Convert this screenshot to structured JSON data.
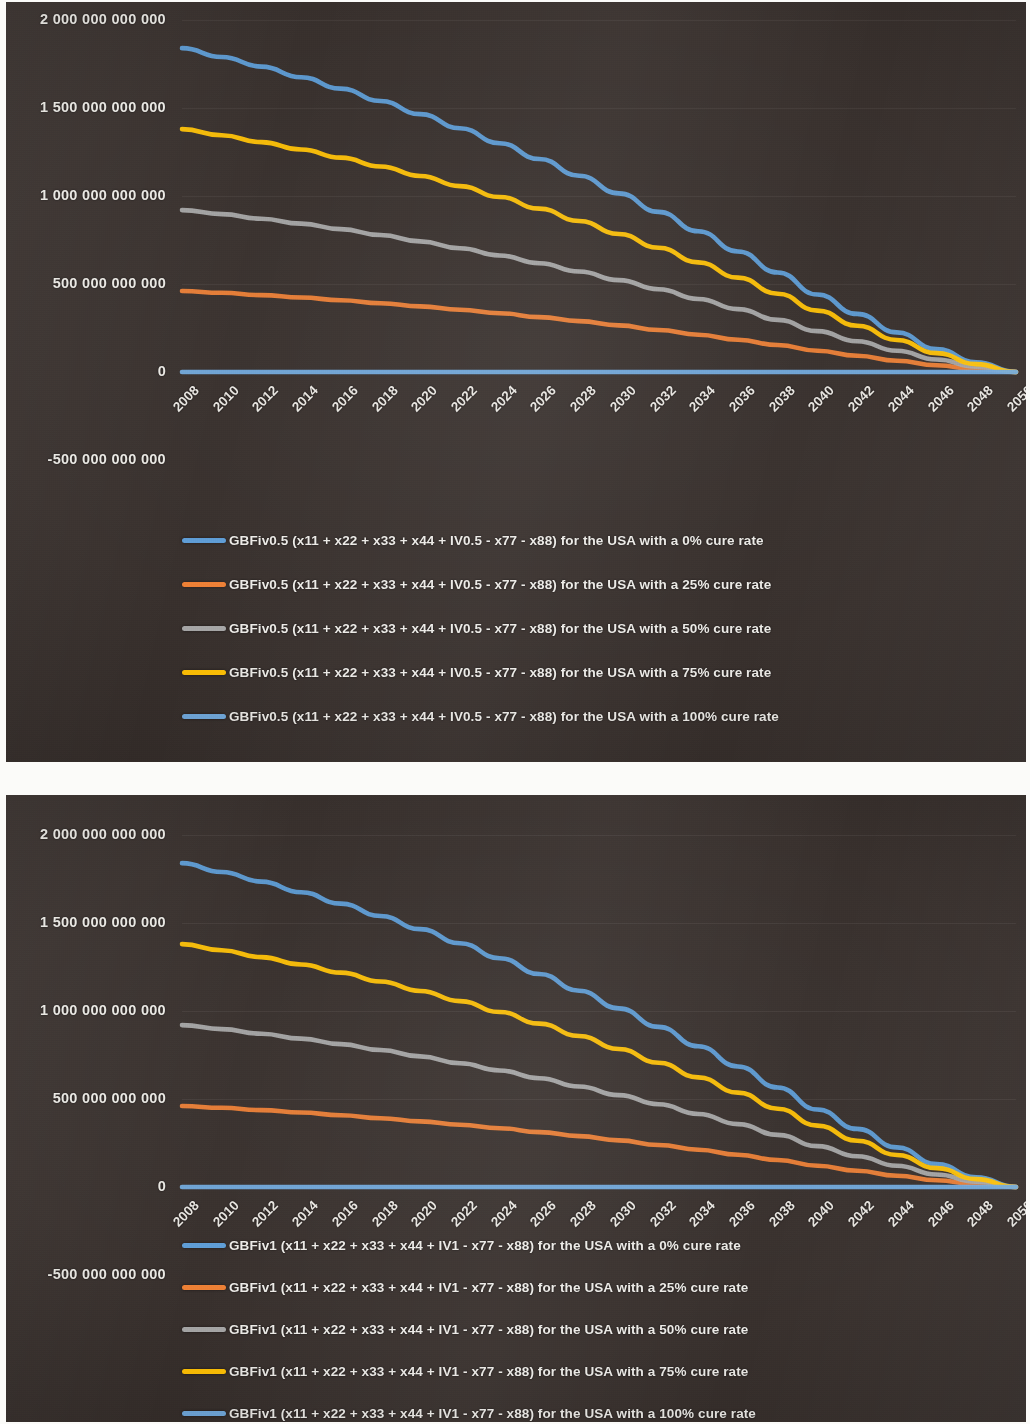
{
  "charts": [
    {
      "id": "chart-gbfiv05",
      "y_axis_labels": [
        "2 000 000 000 000",
        "1 500 000 000 000",
        "1 000 000 000 000",
        "500 000 000 000",
        "0",
        "-500 000 000 000"
      ],
      "x_axis_labels": [
        "2008",
        "2010",
        "2012",
        "2014",
        "2016",
        "2018",
        "2020",
        "2022",
        "2024",
        "2026",
        "2028",
        "2030",
        "2032",
        "2034",
        "2036",
        "2038",
        "2040",
        "2042",
        "2044",
        "2046",
        "2048",
        "2050"
      ],
      "legend": [
        {
          "label": "GBFiv0.5 (x11 + x22 + x33 + x44 + IV0.5 - x77 - x88) for the USA with a 0% cure rate",
          "color": "#5B9BD5"
        },
        {
          "label": "GBFiv0.5 (x11 + x22 + x33 + x44 + IV0.5 - x77 - x88) for the USA with a 25% cure rate",
          "color": "#ED7D31"
        },
        {
          "label": "GBFiv0.5 (x11 + x22 + x33 + x44 + IV0.5 - x77 - x88) for the USA with a 50% cure rate",
          "color": "#A5A5A5"
        },
        {
          "label": "GBFiv0.5 (x11 + x22 + x33 + x44 + IV0.5 - x77 - x88) for the USA with a 75% cure rate",
          "color": "#FFC000"
        },
        {
          "label": "GBFiv0.5 (x11 + x22 + x33 + x44 + IV0.5 - x77 - x88) for the USA with a 100% cure rate",
          "color": "#6FA8DC"
        }
      ]
    },
    {
      "id": "chart-gbfiv1",
      "y_axis_labels": [
        "2 000 000 000 000",
        "1 500 000 000 000",
        "1 000 000 000 000",
        "500 000 000 000",
        "0",
        "-500 000 000 000"
      ],
      "x_axis_labels": [
        "2008",
        "2010",
        "2012",
        "2014",
        "2016",
        "2018",
        "2020",
        "2022",
        "2024",
        "2026",
        "2028",
        "2030",
        "2032",
        "2034",
        "2036",
        "2038",
        "2040",
        "2042",
        "2044",
        "2046",
        "2048",
        "2050"
      ],
      "legend": [
        {
          "label": "GBFiv1 (x11 + x22 + x33 + x44 + IV1 - x77 - x88) for the USA with a 0% cure rate",
          "color": "#5B9BD5"
        },
        {
          "label": "GBFiv1 (x11 + x22 + x33 + x44 + IV1 - x77 - x88) for the USA with a 25% cure rate",
          "color": "#ED7D31"
        },
        {
          "label": "GBFiv1 (x11 + x22 + x33 + x44 + IV1 - x77 - x88) for the USA with a 50% cure rate",
          "color": "#A5A5A5"
        },
        {
          "label": "GBFiv1 (x11 + x22 + x33 + x44 + IV1 - x77 - x88) for the USA with a 75% cure rate",
          "color": "#FFC000"
        },
        {
          "label": "GBFiv1 (x11 + x22 + x33 + x44 + IV1 - x77 - x88) for the USA with a 100% cure rate",
          "color": "#6FA8DC"
        }
      ]
    }
  ],
  "chart_data": [
    {
      "type": "line",
      "title": "",
      "xlabel": "",
      "ylabel": "",
      "grid": true,
      "legend_position": "bottom",
      "xlim": [
        2008,
        2050
      ],
      "ylim": [
        -500000000000,
        2000000000000
      ],
      "yticks": [
        -500000000000,
        0,
        500000000000,
        1000000000000,
        1500000000000,
        2000000000000
      ],
      "ytick_labels": [
        "-500 000 000 000",
        "0",
        "500 000 000 000",
        "1 000 000 000 000",
        "1 500 000 000 000",
        "2 000 000 000 000"
      ],
      "x": [
        2008,
        2010,
        2012,
        2014,
        2016,
        2018,
        2020,
        2022,
        2024,
        2026,
        2028,
        2030,
        2032,
        2034,
        2036,
        2038,
        2040,
        2042,
        2044,
        2046,
        2048,
        2050
      ],
      "series": [
        {
          "name": "GBFiv0.5 (x11 + x22 + x33 + x44 + IV0.5 - x77 - x88) for the USA with a 0% cure rate",
          "color": "#5B9BD5",
          "values": [
            1840000000000,
            1790000000000,
            1735000000000,
            1675000000000,
            1610000000000,
            1540000000000,
            1465000000000,
            1385000000000,
            1300000000000,
            1210000000000,
            1115000000000,
            1015000000000,
            910000000000,
            800000000000,
            685000000000,
            565000000000,
            440000000000,
            330000000000,
            225000000000,
            130000000000,
            55000000000,
            0
          ]
        },
        {
          "name": "GBFiv0.5 (x11 + x22 + x33 + x44 + IV0.5 - x77 - x88) for the USA with a 25% cure rate",
          "color": "#ED7D31",
          "values": [
            460000000000,
            450000000000,
            437000000000,
            423000000000,
            408000000000,
            391000000000,
            373000000000,
            354000000000,
            334000000000,
            312000000000,
            289000000000,
            265000000000,
            239000000000,
            212000000000,
            183000000000,
            153000000000,
            121000000000,
            92000000000,
            64000000000,
            38000000000,
            16000000000,
            0
          ]
        },
        {
          "name": "GBFiv0.5 (x11 + x22 + x33 + x44 + IV0.5 - x77 - x88) for the USA with a 50% cure rate",
          "color": "#A5A5A5",
          "values": [
            920000000000,
            897000000000,
            871000000000,
            843000000000,
            812000000000,
            778000000000,
            742000000000,
            703000000000,
            662000000000,
            618000000000,
            571000000000,
            522000000000,
            470000000000,
            415000000000,
            357000000000,
            296000000000,
            232000000000,
            175000000000,
            121000000000,
            71000000000,
            30000000000,
            0
          ]
        },
        {
          "name": "GBFiv0.5 (x11 + x22 + x33 + x44 + IV0.5 - x77 - x88) for the USA with a 75% cure rate",
          "color": "#FFC000",
          "values": [
            1380000000000,
            1345000000000,
            1306000000000,
            1264000000000,
            1218000000000,
            1168000000000,
            1114000000000,
            1056000000000,
            994000000000,
            928000000000,
            858000000000,
            784000000000,
            706000000000,
            623000000000,
            536000000000,
            445000000000,
            349000000000,
            263000000000,
            182000000000,
            107000000000,
            45000000000,
            0
          ]
        },
        {
          "name": "GBFiv0.5 (x11 + x22 + x33 + x44 + IV0.5 - x77 - x88) for the USA with a 100% cure rate",
          "color": "#6FA8DC",
          "values": [
            0,
            0,
            0,
            0,
            0,
            0,
            0,
            0,
            0,
            0,
            0,
            0,
            0,
            0,
            0,
            0,
            0,
            0,
            0,
            0,
            0,
            0
          ]
        }
      ]
    },
    {
      "type": "line",
      "title": "",
      "xlabel": "",
      "ylabel": "",
      "grid": true,
      "legend_position": "bottom",
      "xlim": [
        2008,
        2050
      ],
      "ylim": [
        -500000000000,
        2000000000000
      ],
      "yticks": [
        -500000000000,
        0,
        500000000000,
        1000000000000,
        1500000000000,
        2000000000000
      ],
      "ytick_labels": [
        "-500 000 000 000",
        "0",
        "500 000 000 000",
        "1 000 000 000 000",
        "1 500 000 000 000",
        "2 000 000 000 000"
      ],
      "x": [
        2008,
        2010,
        2012,
        2014,
        2016,
        2018,
        2020,
        2022,
        2024,
        2026,
        2028,
        2030,
        2032,
        2034,
        2036,
        2038,
        2040,
        2042,
        2044,
        2046,
        2048,
        2050
      ],
      "series": [
        {
          "name": "GBFiv1 (x11 + x22 + x33 + x44 + IV1 - x77 - x88) for the USA with a 0% cure rate",
          "color": "#5B9BD5",
          "values": [
            1840000000000,
            1790000000000,
            1735000000000,
            1675000000000,
            1610000000000,
            1540000000000,
            1465000000000,
            1385000000000,
            1300000000000,
            1210000000000,
            1115000000000,
            1015000000000,
            910000000000,
            800000000000,
            685000000000,
            565000000000,
            440000000000,
            330000000000,
            225000000000,
            130000000000,
            55000000000,
            0
          ]
        },
        {
          "name": "GBFiv1 (x11 + x22 + x33 + x44 + IV1 - x77 - x88) for the USA with a 25% cure rate",
          "color": "#ED7D31",
          "values": [
            460000000000,
            450000000000,
            437000000000,
            423000000000,
            408000000000,
            391000000000,
            373000000000,
            354000000000,
            334000000000,
            312000000000,
            289000000000,
            265000000000,
            239000000000,
            212000000000,
            183000000000,
            153000000000,
            121000000000,
            92000000000,
            64000000000,
            38000000000,
            16000000000,
            0
          ]
        },
        {
          "name": "GBFiv1 (x11 + x22 + x33 + x44 + IV1 - x77 - x88) for the USA with a 50% cure rate",
          "color": "#A5A5A5",
          "values": [
            920000000000,
            897000000000,
            871000000000,
            843000000000,
            812000000000,
            778000000000,
            742000000000,
            703000000000,
            662000000000,
            618000000000,
            571000000000,
            522000000000,
            470000000000,
            415000000000,
            357000000000,
            296000000000,
            232000000000,
            175000000000,
            121000000000,
            71000000000,
            30000000000,
            0
          ]
        },
        {
          "name": "GBFiv1 (x11 + x22 + x33 + x44 + IV1 - x77 - x88) for the USA with a 75% cure rate",
          "color": "#FFC000",
          "values": [
            1380000000000,
            1345000000000,
            1306000000000,
            1264000000000,
            1218000000000,
            1168000000000,
            1114000000000,
            1056000000000,
            994000000000,
            928000000000,
            858000000000,
            784000000000,
            706000000000,
            623000000000,
            536000000000,
            445000000000,
            349000000000,
            263000000000,
            182000000000,
            107000000000,
            45000000000,
            0
          ]
        },
        {
          "name": "GBFiv1 (x11 + x22 + x33 + x44 + IV1 - x77 - x88) for the USA with a 100% cure rate",
          "color": "#6FA8DC",
          "values": [
            0,
            0,
            0,
            0,
            0,
            0,
            0,
            0,
            0,
            0,
            0,
            0,
            0,
            0,
            0,
            0,
            0,
            0,
            0,
            0,
            0,
            0
          ]
        }
      ]
    }
  ]
}
